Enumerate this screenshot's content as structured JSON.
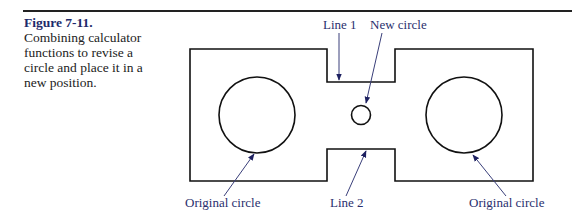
{
  "caption": {
    "figure_label": "Figure 7-11.",
    "text": "Combining calculator functions to revise a circle and place it in a new position."
  },
  "diagram": {
    "labels": {
      "line1": "Line 1",
      "new_circle": "New circle",
      "original_circle_left": "Original circle",
      "line2": "Line 2",
      "original_circle_right": "Original circle"
    },
    "colors": {
      "outline": "#111111",
      "leader": "#3a3f7a",
      "label": "#2a2f6e",
      "caption_heading": "#1d2a6b"
    }
  }
}
